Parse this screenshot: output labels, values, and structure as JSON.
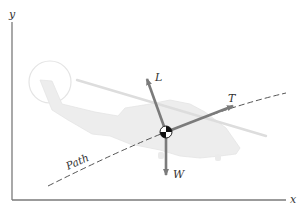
{
  "diagram": {
    "type": "free-body diagram",
    "axes": {
      "x_label": "x",
      "y_label": "y"
    },
    "path_label": "Path",
    "forces": [
      {
        "symbol": "L",
        "meaning": "lift",
        "direction": "up-left"
      },
      {
        "symbol": "T",
        "meaning": "thrust",
        "direction": "up-right along path"
      },
      {
        "symbol": "W",
        "meaning": "weight",
        "direction": "down"
      }
    ],
    "center_of_mass_marker": "center-of-mass-symbol"
  },
  "colors": {
    "axis": "#7a7a7a",
    "vector": "#7b7b7b",
    "path": "#555555",
    "helicopter_fill": "#ececec",
    "helicopter_outline": "#e2e2e2",
    "rotor": "#dcdcdc",
    "label": "#333333"
  }
}
